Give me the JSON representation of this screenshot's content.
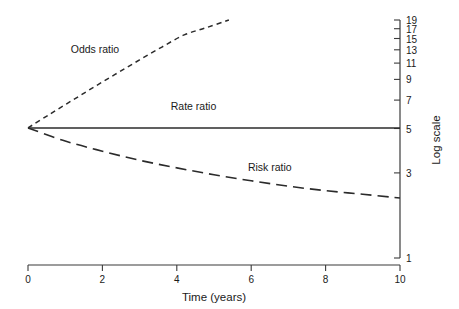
{
  "chart_data": {
    "type": "line",
    "title": "",
    "xlabel": "Time (years)",
    "ylabel": "Log scale",
    "xlim": [
      0,
      10
    ],
    "ylim": [
      1,
      19
    ],
    "yscale": "log",
    "grid": false,
    "legend_position": "inline-annotations",
    "x_ticks": [
      "0",
      "2",
      "4",
      "6",
      "8",
      "10"
    ],
    "x_tick_values": [
      0,
      2,
      4,
      6,
      8,
      10
    ],
    "y_ticks": [
      "1",
      "3",
      "5",
      "7",
      "9",
      "11",
      "13",
      "15",
      "17",
      "19"
    ],
    "y_tick_values": [
      1,
      3,
      5,
      7,
      9,
      11,
      13,
      15,
      17,
      19
    ],
    "axis_color": "#3b3b3b",
    "series": [
      {
        "name": "Odds ratio",
        "style": "short-dashed",
        "color": "#2b2b2b",
        "label": "Odds ratio",
        "label_x": 1.8,
        "label_y": 12.6,
        "x": [
          0,
          0.6,
          1.2,
          1.8,
          2.4,
          3.0,
          3.6,
          4.2,
          4.8,
          5.4
        ],
        "values": [
          5.0,
          5.95,
          7.05,
          8.35,
          9.85,
          11.6,
          13.6,
          15.8,
          17.3,
          19.0
        ]
      },
      {
        "name": "Rate ratio",
        "style": "solid",
        "color": "#2b2b2b",
        "label": "Rate ratio",
        "label_x": 4.45,
        "label_y": 6.25,
        "x": [
          0,
          2,
          4,
          6,
          8,
          10
        ],
        "values": [
          5.0,
          5.0,
          5.0,
          5.0,
          5.0,
          5.0
        ]
      },
      {
        "name": "Risk ratio",
        "style": "long-dashed",
        "color": "#2b2b2b",
        "label": "Risk ratio",
        "label_x": 6.5,
        "label_y": 2.95,
        "x": [
          0,
          1,
          2,
          3,
          4,
          5,
          6,
          7,
          8,
          9,
          10
        ],
        "values": [
          5.0,
          4.25,
          3.75,
          3.35,
          3.05,
          2.8,
          2.6,
          2.43,
          2.3,
          2.2,
          2.1
        ]
      }
    ]
  },
  "axes": {
    "x_axis_name": "time-axis",
    "y_axis_name": "log-scale-axis"
  }
}
